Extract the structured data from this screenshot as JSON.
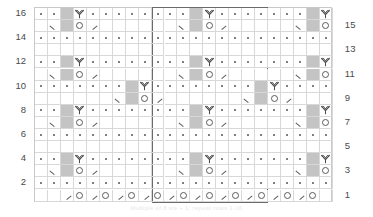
{
  "chart": {
    "caption": "Multiple of 8 sts + 1; repeat rows 1-16",
    "columns": 23,
    "rows": 16,
    "cell_width": 12.95,
    "cell_height": 12.1,
    "grid_left": 34,
    "grid_top": 7,
    "colors": {
      "shade": "#c4c4c4",
      "grid_line": "#d8d8d8",
      "border": "#c9c9c9",
      "repeat_border": "#6a6a6a",
      "symbol": "#5a5a5a",
      "label": "#4a4a4a"
    },
    "repeat": {
      "label": "pattern-repeat",
      "start_col": 10,
      "end_col": 18
    },
    "row_labels_left": [
      "16",
      "14",
      "12",
      "10",
      "8",
      "6",
      "4",
      "2"
    ],
    "row_labels_right": [
      "15",
      "13",
      "11",
      "9",
      "7",
      "5",
      "3",
      "1"
    ],
    "legend_symbols": {
      "dot": "purl",
      "yo": "yarn-over",
      "k2tog": "knit-two-together",
      "ssk": "slip-slip-knit",
      "cluster": "cluster-three-into-three",
      "shade": "no-stitch-shaded"
    },
    "grid": [
      {
        "row": 16,
        "cells": [
          "dot",
          "dot",
          "shade",
          "cluster",
          "dot",
          "dot",
          "dot",
          "dot",
          "dot",
          "dot",
          "dot",
          "dot",
          "shade",
          "cluster",
          "dot",
          "dot",
          "dot",
          "dot",
          "dot",
          "dot",
          "dot",
          "shade",
          "cluster"
        ]
      },
      {
        "row": 15,
        "cells": [
          "",
          "ssk",
          "shade",
          "yo",
          "k2tog",
          "",
          "",
          "",
          "",
          "",
          "",
          "ssk",
          "shade",
          "yo",
          "k2tog",
          "",
          "",
          "",
          "",
          "",
          "ssk",
          "shade",
          "yo"
        ]
      },
      {
        "row": 14,
        "cells": [
          "dot",
          "dot",
          "dot",
          "dot",
          "dot",
          "dot",
          "dot",
          "dot",
          "dot",
          "dot",
          "dot",
          "dot",
          "dot",
          "dot",
          "dot",
          "dot",
          "dot",
          "dot",
          "dot",
          "dot",
          "dot",
          "dot",
          "dot"
        ]
      },
      {
        "row": 13,
        "cells": [
          "",
          "",
          "",
          "",
          "",
          "",
          "",
          "",
          "",
          "",
          "",
          "",
          "",
          "",
          "",
          "",
          "",
          "",
          "",
          "",
          "",
          "",
          ""
        ]
      },
      {
        "row": 12,
        "cells": [
          "dot",
          "dot",
          "shade",
          "cluster",
          "dot",
          "dot",
          "dot",
          "dot",
          "dot",
          "dot",
          "dot",
          "dot",
          "shade",
          "cluster",
          "dot",
          "dot",
          "dot",
          "dot",
          "dot",
          "dot",
          "dot",
          "shade",
          "cluster"
        ]
      },
      {
        "row": 11,
        "cells": [
          "",
          "ssk",
          "shade",
          "yo",
          "k2tog",
          "",
          "",
          "",
          "",
          "",
          "",
          "ssk",
          "shade",
          "yo",
          "k2tog",
          "",
          "",
          "",
          "",
          "",
          "ssk",
          "shade",
          "yo"
        ]
      },
      {
        "row": 10,
        "cells": [
          "dot",
          "dot",
          "dot",
          "dot",
          "dot",
          "dot",
          "dot",
          "shade",
          "cluster",
          "dot",
          "dot",
          "dot",
          "dot",
          "dot",
          "dot",
          "dot",
          "dot",
          "shade",
          "cluster",
          "dot",
          "dot",
          "dot",
          "dot"
        ]
      },
      {
        "row": 9,
        "cells": [
          "",
          "",
          "",
          "",
          "",
          "",
          "ssk",
          "shade",
          "yo",
          "k2tog",
          "",
          "",
          "",
          "",
          "",
          "",
          "ssk",
          "shade",
          "yo",
          "k2tog",
          "",
          "",
          ""
        ]
      },
      {
        "row": 8,
        "cells": [
          "dot",
          "dot",
          "shade",
          "cluster",
          "dot",
          "dot",
          "dot",
          "dot",
          "dot",
          "dot",
          "dot",
          "dot",
          "shade",
          "cluster",
          "dot",
          "dot",
          "dot",
          "dot",
          "dot",
          "dot",
          "dot",
          "shade",
          "cluster"
        ]
      },
      {
        "row": 7,
        "cells": [
          "",
          "ssk",
          "shade",
          "yo",
          "k2tog",
          "",
          "",
          "",
          "",
          "",
          "",
          "ssk",
          "shade",
          "yo",
          "k2tog",
          "",
          "",
          "",
          "",
          "",
          "ssk",
          "shade",
          "yo"
        ]
      },
      {
        "row": 6,
        "cells": [
          "dot",
          "dot",
          "dot",
          "dot",
          "dot",
          "dot",
          "dot",
          "dot",
          "dot",
          "dot",
          "dot",
          "dot",
          "dot",
          "dot",
          "dot",
          "dot",
          "dot",
          "dot",
          "dot",
          "dot",
          "dot",
          "dot",
          "dot"
        ]
      },
      {
        "row": 5,
        "cells": [
          "",
          "",
          "",
          "",
          "",
          "",
          "",
          "",
          "",
          "",
          "",
          "",
          "",
          "",
          "",
          "",
          "",
          "",
          "",
          "",
          "",
          "",
          ""
        ]
      },
      {
        "row": 4,
        "cells": [
          "dot",
          "dot",
          "shade",
          "cluster",
          "dot",
          "dot",
          "dot",
          "dot",
          "dot",
          "dot",
          "dot",
          "dot",
          "shade",
          "cluster",
          "dot",
          "dot",
          "dot",
          "dot",
          "dot",
          "dot",
          "dot",
          "shade",
          "cluster"
        ]
      },
      {
        "row": 3,
        "cells": [
          "",
          "ssk",
          "shade",
          "yo",
          "k2tog",
          "",
          "",
          "",
          "",
          "",
          "",
          "ssk",
          "shade",
          "yo",
          "k2tog",
          "",
          "",
          "",
          "",
          "",
          "ssk",
          "shade",
          "yo"
        ]
      },
      {
        "row": 2,
        "cells": [
          "dot",
          "dot",
          "dot",
          "dot",
          "dot",
          "dot",
          "dot",
          "dot",
          "dot",
          "dot",
          "dot",
          "dot",
          "dot",
          "dot",
          "dot",
          "dot",
          "dot",
          "dot",
          "dot",
          "dot",
          "dot",
          "dot",
          "dot"
        ]
      },
      {
        "row": 1,
        "cells": [
          "",
          "",
          "k2tog",
          "yo",
          "k2tog",
          "yo",
          "k2tog",
          "yo",
          "k2tog",
          "yo",
          "k2tog",
          "yo",
          "k2tog",
          "yo",
          "k2tog",
          "yo",
          "k2tog",
          "yo",
          "k2tog",
          "yo",
          "k2tog",
          "yo",
          ""
        ]
      }
    ]
  }
}
